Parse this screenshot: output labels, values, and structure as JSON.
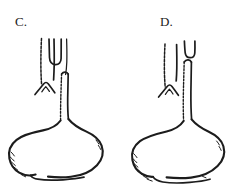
{
  "figure": {
    "style": "pen-and-ink line drawing",
    "background_color": "#ffffff",
    "ink_color": "#1c1c1c",
    "panel_count": 2
  },
  "panels": [
    {
      "id": "C",
      "label": "C.",
      "label_position": "top-left",
      "description": "Upper esophageal segment ends in a blind pouch; a long narrow lower segment runs from the trachea down to the stomach.",
      "parts": [
        {
          "name": "trachea",
          "note": "vertical tube at left with stippled/rough anterior wall"
        },
        {
          "name": "upper-esophageal-pouch",
          "note": "narrow elongated U-shaped blind pouch"
        },
        {
          "name": "carina-bifurcation",
          "note": "inverted-V bronchial split at base of trachea"
        },
        {
          "name": "lower-esophageal-segment",
          "note": "long tube descending to the stomach"
        },
        {
          "name": "stomach",
          "note": "rounded sac, fundus upper left, pylorus lower left"
        }
      ]
    },
    {
      "id": "D",
      "label": "D.",
      "label_position": "top-left",
      "description": "Short blind upper esophageal pouch offset to the right; lower segment joins the trachea and continues to the stomach.",
      "parts": [
        {
          "name": "trachea",
          "note": "vertical tube at left with stippled/rough anterior wall"
        },
        {
          "name": "upper-esophageal-pouch",
          "note": "short shallow U-shaped blind pouch set high and to the right"
        },
        {
          "name": "carina-bifurcation",
          "note": "inverted-V bronchial split at base of trachea"
        },
        {
          "name": "lower-esophageal-segment",
          "note": "tube descending to the stomach with stippled wall"
        },
        {
          "name": "stomach",
          "note": "rounded sac with tapered pyloric/duodenal end at lower left"
        }
      ]
    }
  ]
}
